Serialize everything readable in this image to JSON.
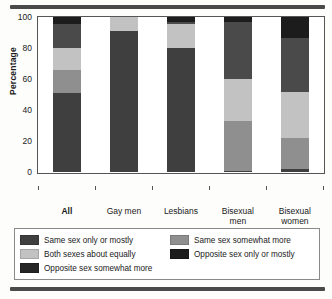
{
  "chart_data": {
    "type": "bar",
    "subtype": "stacked-percentage",
    "title": "",
    "xlabel": "",
    "ylabel": "Percentage",
    "ylim": [
      0,
      100
    ],
    "yticks": [
      0,
      20,
      40,
      60,
      80,
      100
    ],
    "grid": false,
    "legend_position": "bottom",
    "categories": [
      "All",
      "Gay men",
      "Lesbians",
      "Bisexual men",
      "Bisexual women"
    ],
    "category_labels_multiline": [
      [
        "All"
      ],
      [
        "Gay men"
      ],
      [
        "Lesbians"
      ],
      [
        "Bisexual",
        "men"
      ],
      [
        "Bisexual",
        "women"
      ]
    ],
    "series": [
      {
        "name": "Same sex only or mostly",
        "color": "#3f3f3f",
        "values": [
          51,
          91,
          80,
          1,
          2
        ]
      },
      {
        "name": "Same sex somewhat more",
        "color": "#8f8f8f",
        "values": [
          15,
          0,
          0,
          32,
          20
        ]
      },
      {
        "name": "Both sexes about equally",
        "color": "#c2c2c2",
        "values": [
          14,
          9,
          16,
          27,
          30
        ]
      },
      {
        "name": "Opposite sex somewhat more",
        "color": "#4a4a4a",
        "values": [
          16,
          0,
          1,
          37,
          35
        ]
      },
      {
        "name": "Opposite sex only or mostly",
        "color": "#1c1c1c",
        "values": [
          4,
          0,
          3,
          3,
          13
        ]
      }
    ]
  },
  "legend": {
    "items": [
      {
        "label": "Same sex only or mostly",
        "color": "#3f3f3f"
      },
      {
        "label": "Same sex somewhat more",
        "color": "#8f8f8f"
      },
      {
        "label": "Both sexes about equally",
        "color": "#c2c2c2"
      },
      {
        "label": "Opposite sex only or mostly",
        "color": "#1c1c1c"
      },
      {
        "label": "Opposite sex somewhat more",
        "color": "#252525"
      }
    ]
  },
  "colors": {
    "rule": "#4a4a4a",
    "axis": "#555555",
    "background": "#ffffff"
  }
}
